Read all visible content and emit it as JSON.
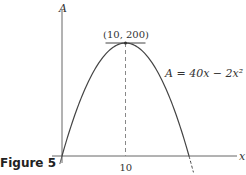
{
  "figure_label": "Figure 5",
  "chart_data": {
    "type": "line",
    "title": "",
    "xlabel": "x",
    "ylabel": "A",
    "equation_label": "A = 40x − 2x²",
    "function": {
      "a": -2,
      "b": 40,
      "c": 0
    },
    "xlim": [
      0,
      20
    ],
    "ylim": [
      0,
      200
    ],
    "x_ticks": [
      10
    ],
    "x_tick_labels": [
      "10"
    ],
    "vertex": {
      "x": 10,
      "y": 200,
      "label": "(10, 200)"
    },
    "roots": [
      0,
      20
    ],
    "grid": false,
    "annotations": [
      "dashed vertical line at x = 10",
      "horizontal tangent at vertex"
    ]
  }
}
